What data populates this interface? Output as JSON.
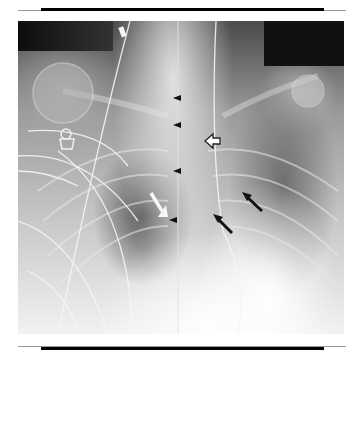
{
  "image": {
    "subject": "Frontal chest radiograph with annotation arrows",
    "annotations": [
      {
        "type": "black-arrowhead",
        "x": 178,
        "y": 103
      },
      {
        "type": "black-arrowhead",
        "x": 178,
        "y": 126
      },
      {
        "type": "black-arrowhead",
        "x": 178,
        "y": 172
      },
      {
        "type": "black-arrowhead",
        "x": 174,
        "y": 221
      },
      {
        "type": "hollow-arrow",
        "x": 210,
        "y": 141
      },
      {
        "type": "hollow-arrow",
        "x": 237,
        "y": 361
      },
      {
        "type": "black-arrow",
        "x": 236,
        "y": 185
      },
      {
        "type": "black-arrow",
        "x": 207,
        "y": 205
      },
      {
        "type": "white-arrow",
        "x": 146,
        "y": 200
      }
    ]
  }
}
